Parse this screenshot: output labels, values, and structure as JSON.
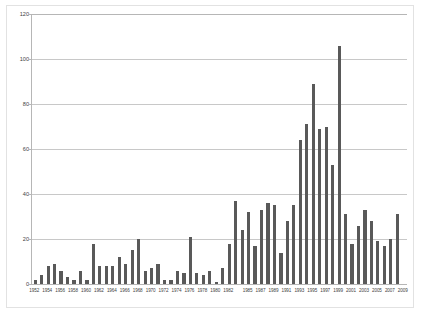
{
  "chart_data": {
    "type": "bar",
    "title": "",
    "subtitle": "",
    "xlabel": "",
    "ylabel": "",
    "ylim": [
      0,
      120
    ],
    "yticks": [
      0,
      20,
      40,
      60,
      80,
      100,
      120
    ],
    "grid": true,
    "legend": false,
    "legend_position": "none",
    "bar_color": "#595959",
    "gridline_color": "#c8c8c8",
    "axis_color": "#b6b6b6",
    "frame_color": "#e2e2e2",
    "x_tick_step": 2,
    "categories": [
      "1952",
      "1953",
      "1954",
      "1955",
      "1956",
      "1957",
      "1958",
      "1959",
      "1960",
      "1961",
      "1962",
      "1963",
      "1964",
      "1965",
      "1966",
      "1967",
      "1968",
      "1969",
      "1970",
      "1971",
      "1972",
      "1973",
      "1974",
      "1975",
      "1976",
      "1977",
      "1978",
      "1979",
      "1980",
      "1981",
      "1982",
      "1983",
      "1984",
      "1985",
      "1986",
      "1987",
      "1988",
      "1989",
      "1990",
      "1991",
      "1992",
      "1993",
      "1994",
      "1995",
      "1996",
      "1997",
      "1998",
      "1999",
      "2000",
      "2001",
      "2002",
      "2003",
      "2004",
      "2005",
      "2006",
      "2007",
      "2008",
      "2009"
    ],
    "values": [
      2,
      4,
      8,
      9,
      6,
      3,
      2,
      6,
      2,
      18,
      8,
      8,
      8,
      12,
      9,
      15,
      20,
      6,
      7,
      9,
      2,
      2,
      6,
      5,
      21,
      5,
      4,
      6,
      1,
      7,
      18,
      37,
      24,
      32,
      17,
      33,
      36,
      35,
      14,
      28,
      35,
      64,
      71,
      89,
      69,
      70,
      53,
      106,
      31,
      18,
      26,
      33,
      28,
      19,
      17,
      20,
      31,
      0
    ],
    "tick_labels": [
      "1952",
      "1954",
      "1956",
      "1958",
      "1960",
      "1962",
      "1964",
      "1966",
      "1968",
      "1970",
      "1972",
      "1974",
      "1976",
      "1978",
      "1980",
      "1982",
      "1985",
      "1987",
      "1989",
      "1991",
      "1993",
      "1995",
      "1997",
      "1999",
      "2001",
      "2003",
      "2005",
      "2007",
      "2009"
    ]
  }
}
